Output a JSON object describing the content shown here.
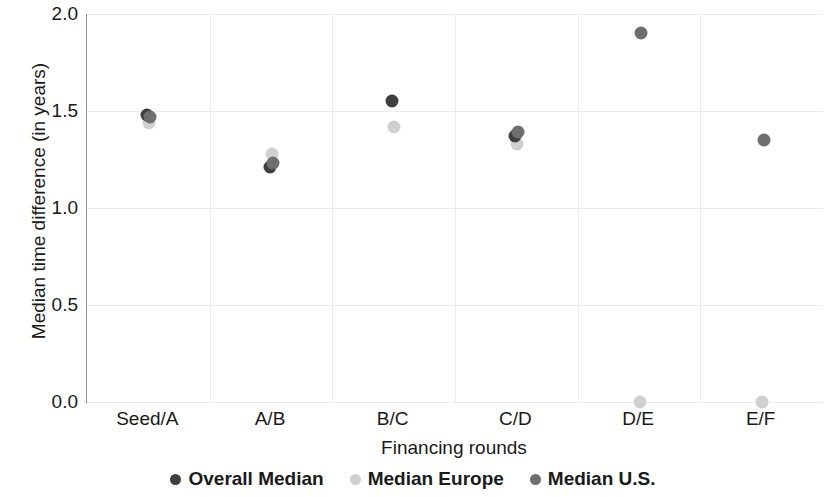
{
  "chart_data": {
    "type": "scatter",
    "title": "",
    "xlabel": "Financing rounds",
    "ylabel": "Median time difference (in years)",
    "categories": [
      "Seed/A",
      "A/B",
      "B/C",
      "C/D",
      "D/E",
      "E/F"
    ],
    "ylim": [
      0.0,
      2.0
    ],
    "yticks": [
      "0.0",
      "0.5",
      "1.0",
      "1.5",
      "2.0"
    ],
    "ytick_values": [
      0.0,
      0.5,
      1.0,
      1.5,
      2.0
    ],
    "grid": true,
    "legend_position": "bottom",
    "series": [
      {
        "name": "Overall Median",
        "color": "#3f3f3f",
        "values": [
          1.48,
          1.21,
          1.55,
          1.37,
          null,
          null
        ]
      },
      {
        "name": "Median Europe",
        "color": "#d0d0d0",
        "values": [
          1.44,
          1.28,
          1.42,
          1.33,
          0.0,
          0.0
        ]
      },
      {
        "name": "Median U.S.",
        "color": "#6e6e6e",
        "values": [
          1.47,
          1.23,
          null,
          1.39,
          1.9,
          1.35
        ]
      }
    ]
  },
  "legend": {
    "items": [
      {
        "label": "Overall Median",
        "color": "#3f3f3f"
      },
      {
        "label": "Median Europe",
        "color": "#d0d0d0"
      },
      {
        "label": "Median U.S.",
        "color": "#6e6e6e"
      }
    ]
  },
  "axes": {
    "y_title": "Median time difference (in years)",
    "x_title": "Financing rounds",
    "y_ticks": [
      "2.0",
      "1.5",
      "1.0",
      "0.5",
      "0.0"
    ],
    "x_ticks": [
      "Seed/A",
      "A/B",
      "B/C",
      "C/D",
      "D/E",
      "E/F"
    ]
  },
  "style": {
    "grid_color": "#ececec",
    "axis_color": "#8f8f8f",
    "text_color": "#1a1a1a",
    "background": "#ffffff"
  }
}
